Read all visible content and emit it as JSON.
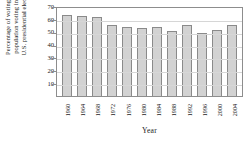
{
  "chart_data": {
    "type": "bar",
    "title": "",
    "xlabel": "Year",
    "ylabel": "Percentage of voting age population voting in the U.S. presidential election",
    "categories": [
      "1960",
      "1964",
      "1968",
      "1972",
      "1976",
      "1980",
      "1984",
      "1988",
      "1992",
      "1996",
      "2000",
      "2004"
    ],
    "values": [
      63.1,
      62.4,
      61.1,
      55.5,
      53.5,
      53.0,
      53.3,
      50.4,
      55.3,
      49.1,
      51.4,
      55.4
    ],
    "ylim": [
      0,
      70
    ],
    "yticks": [
      10,
      20,
      30,
      40,
      50,
      60,
      70
    ],
    "grid": true,
    "legend": "none",
    "bar_color": "#d2d2d2",
    "bar_border_color": "#8a8a8a",
    "axis_color": "#8d8d8d",
    "background": "#ffffff"
  },
  "ylabel_lines": [
    "Percentage of voting age",
    "population voting in the",
    "U.S. presidential election"
  ]
}
